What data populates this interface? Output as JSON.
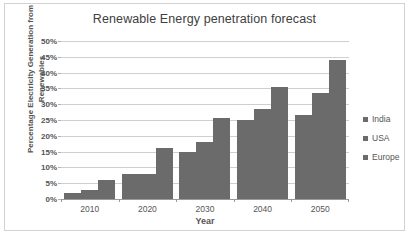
{
  "chart_data": {
    "type": "bar",
    "title": "Renewable Energy penetration forecast",
    "xlabel": "Year",
    "ylabel": "Percentage Electricity Generation from Renewables",
    "categories": [
      "2010",
      "2020",
      "2030",
      "2040",
      "2050"
    ],
    "series": [
      {
        "name": "India",
        "values": [
          2,
          8,
          15,
          25,
          26.5
        ]
      },
      {
        "name": "USA",
        "values": [
          3,
          8,
          18,
          28.5,
          33.5
        ]
      },
      {
        "name": "Europe",
        "values": [
          6,
          16,
          25.5,
          35.5,
          44
        ]
      }
    ],
    "ylim": [
      0,
      50
    ],
    "ytick_step": 5,
    "ytick_labels": [
      "50%",
      "45%",
      "40%",
      "35%",
      "30%",
      "25%",
      "20%",
      "15%",
      "10%",
      "5%",
      "0%"
    ],
    "grid": true,
    "legend_position": "right",
    "bar_color": "#6b6b6b",
    "gridline_color": "#cfcfcf",
    "text_color": "#555555"
  },
  "axis_title_lines": {
    "line1": "Percentage Electricity Generation from",
    "line2": "Renewables"
  },
  "caption": {
    "text": ""
  }
}
